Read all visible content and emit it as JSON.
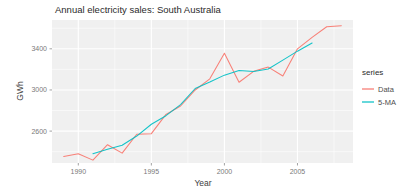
{
  "chart_data": {
    "type": "line",
    "title": "Annual electricity sales: South Australia",
    "xlabel": "Year",
    "ylabel": "GWh",
    "xlim": [
      1988.2,
      2008.8
    ],
    "ylim": [
      2290,
      3680
    ],
    "xticks": [
      1990,
      1995,
      2000,
      2005
    ],
    "yticks": [
      2600,
      3000,
      3400
    ],
    "grid": true,
    "legend": {
      "title": "series",
      "position": "right",
      "entries": [
        {
          "label": "Data",
          "color": "#f8766d"
        },
        {
          "label": "5-MA",
          "color": "#00bfc4"
        }
      ]
    },
    "x": [
      1989,
      1990,
      1991,
      1992,
      1993,
      1994,
      1995,
      1996,
      1997,
      1998,
      1999,
      2000,
      2001,
      2002,
      2003,
      2004,
      2005,
      2006,
      2007,
      2008
    ],
    "series": [
      {
        "name": "Data",
        "color": "#f8766d",
        "values": [
          2354,
          2379,
          2318,
          2468,
          2386,
          2569,
          2575,
          2762,
          2844,
          3000,
          3108,
          3357,
          3075,
          3181,
          3222,
          3136,
          3400,
          3511,
          3614,
          3625
        ]
      },
      {
        "name": "5-MA",
        "color": "#00bfc4",
        "values": [
          null,
          null,
          2381,
          2424,
          2463,
          2552,
          2667,
          2750,
          2858,
          3014,
          3077,
          3144,
          3189,
          3179,
          3203,
          3290,
          3377,
          3457,
          null,
          null
        ]
      }
    ]
  },
  "panel": {
    "background": "#f0f0f0",
    "gridline_color": "#ffffff"
  }
}
